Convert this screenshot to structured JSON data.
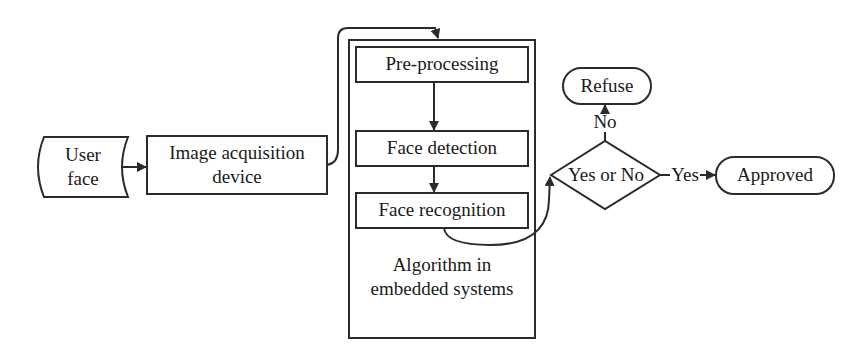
{
  "diagram": {
    "type": "flowchart",
    "nodes": {
      "user_face": {
        "line1": "User",
        "line2": "face",
        "shape": "stored-data"
      },
      "image_acquisition": {
        "line1": "Image acquisition",
        "line2": "device",
        "shape": "rectangle"
      },
      "container": {
        "line1": "Algorithm in",
        "line2": "embedded systems",
        "shape": "rectangle"
      },
      "pre_processing": {
        "label": "Pre-processing",
        "shape": "rectangle"
      },
      "face_detection": {
        "label": "Face detection",
        "shape": "rectangle"
      },
      "face_recognition": {
        "label": "Face recognition",
        "shape": "rectangle"
      },
      "decision": {
        "label": "Yes or No",
        "shape": "diamond"
      },
      "refuse": {
        "label": "Refuse",
        "shape": "terminator"
      },
      "approved": {
        "label": "Approved",
        "shape": "terminator"
      }
    },
    "edges": {
      "no_label": "No",
      "yes_label": "Yes"
    },
    "connections": [
      {
        "from": "User face",
        "to": "Image acquisition device"
      },
      {
        "from": "Image acquisition device",
        "to": "Pre-processing"
      },
      {
        "from": "Pre-processing",
        "to": "Face detection"
      },
      {
        "from": "Face detection",
        "to": "Face recognition"
      },
      {
        "from": "Face recognition",
        "to": "Yes or No"
      },
      {
        "from": "Yes or No",
        "to": "Refuse",
        "label": "No"
      },
      {
        "from": "Yes or No",
        "to": "Approved",
        "label": "Yes"
      }
    ],
    "colors": {
      "stroke": "#2b2b2b",
      "fill": "#ffffff",
      "text": "#1a1a1a"
    }
  }
}
